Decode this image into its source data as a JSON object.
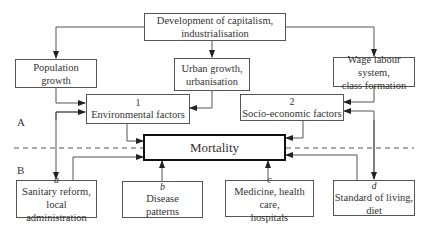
{
  "top": {
    "line1": "Development of capitalism,",
    "line2": "industrialisation"
  },
  "level1": [
    {
      "line1": "Population",
      "line2": "growth"
    },
    {
      "line1": "Urban growth,",
      "line2": "urbanisation"
    },
    {
      "line1": "Wage labour system,",
      "line2": "class formation"
    }
  ],
  "factors": [
    {
      "num": "1",
      "label": "Environmental factors"
    },
    {
      "num": "2",
      "label": "Socio-economic factors"
    }
  ],
  "center": {
    "label": "Mortality"
  },
  "sections": {
    "a": "A",
    "b": "B"
  },
  "bottom": [
    {
      "letter": "a",
      "line1": "Sanitary reform,",
      "line2": "local administration"
    },
    {
      "letter": "b",
      "line1": "Disease",
      "line2": "patterns"
    },
    {
      "letter": "c",
      "line1": "Medicine, health care,",
      "line2": "hospitals"
    },
    {
      "letter": "d",
      "line1": "Standard of living,",
      "line2": "diet"
    }
  ]
}
